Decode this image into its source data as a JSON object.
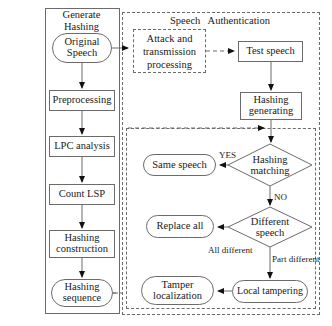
{
  "diagram": {
    "type": "flowchart",
    "panels": [
      {
        "id": "generate-hashing",
        "title": "Generate\nHashing",
        "style": "solid"
      },
      {
        "id": "speech-authentication",
        "title": "Speech   Authentication",
        "style": "dashed"
      },
      {
        "id": "attack-transmission",
        "title": "",
        "style": "dashed"
      },
      {
        "id": "authentication-inner",
        "title": "",
        "style": "dashed"
      }
    ],
    "nodes": [
      {
        "id": "original-speech",
        "label": "Original\nSpeech",
        "shape": "rounded"
      },
      {
        "id": "preprocessing",
        "label": "Preprocessing",
        "shape": "rect"
      },
      {
        "id": "lpc-analysis",
        "label": "LPC analysis",
        "shape": "rect"
      },
      {
        "id": "count-lsp",
        "label": "Count LSP",
        "shape": "rect"
      },
      {
        "id": "hashing-construction",
        "label": "Hashing\nconstruction",
        "shape": "rect"
      },
      {
        "id": "hashing-sequence",
        "label": "Hashing\nsequence",
        "shape": "rounded"
      },
      {
        "id": "attack-processing",
        "label": "Attack and\ntransmission\nprocessing",
        "shape": "dashed-rect"
      },
      {
        "id": "test-speech",
        "label": "Test speech",
        "shape": "rect"
      },
      {
        "id": "hashing-generating",
        "label": "Hashing\ngenerating",
        "shape": "rect"
      },
      {
        "id": "hashing-matching",
        "label": "Hashing\nmatching",
        "shape": "diamond"
      },
      {
        "id": "same-speech",
        "label": "Same speech",
        "shape": "rounded"
      },
      {
        "id": "different-speech",
        "label": "Different\nspeech",
        "shape": "diamond"
      },
      {
        "id": "replace-all",
        "label": "Replace all",
        "shape": "rounded"
      },
      {
        "id": "local-tampering",
        "label": "Local tampering",
        "shape": "rounded"
      },
      {
        "id": "tamper-localization",
        "label": "Tamper\nlocalization",
        "shape": "rounded"
      }
    ],
    "edge_labels": {
      "yes": "YES",
      "no": "NO",
      "all_different": "All different",
      "part_different": "Part different"
    },
    "colors": {
      "stroke": "#6b6b6b",
      "arrow": "#111111",
      "text": "#1a1a1a",
      "background": "#ffffff"
    }
  }
}
